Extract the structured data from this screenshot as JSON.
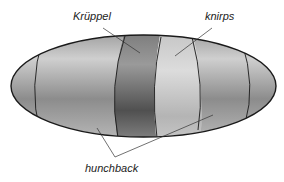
{
  "diagram": {
    "labels": {
      "kruppel": "Krüppel",
      "knirps": "knirps",
      "hunchback": "hunchback"
    },
    "colors": {
      "outline": "#1a1a1a",
      "band_light": "#c8c8c8",
      "band_mid": "#a8a8a8",
      "band_dark": "#6e6e6e",
      "band_knirps": "#d2d2d2",
      "leader_line": "#333333",
      "label_text": "#222222"
    }
  }
}
